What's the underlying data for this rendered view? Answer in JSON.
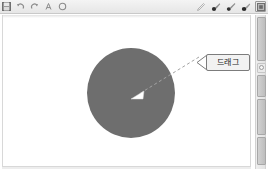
{
  "toolbar": {
    "left_tools": [
      {
        "name": "save-icon",
        "glyph": "save"
      },
      {
        "name": "undo-icon",
        "glyph": "undo"
      },
      {
        "name": "redo-icon",
        "glyph": "redo"
      },
      {
        "name": "text-icon",
        "glyph": "text"
      },
      {
        "name": "shape-icon",
        "glyph": "shape"
      }
    ],
    "right_tools": [
      {
        "name": "pencil-icon",
        "glyph": "pencil",
        "selected": false
      },
      {
        "name": "brush-icon",
        "glyph": "brush",
        "selected": false
      },
      {
        "name": "marker-icon",
        "glyph": "marker",
        "selected": false
      },
      {
        "name": "highlighter-icon",
        "glyph": "brush2",
        "selected": false
      },
      {
        "name": "shape-tool-icon",
        "glyph": "square",
        "selected": true
      }
    ]
  },
  "canvas": {
    "shape": {
      "type": "ellipse",
      "fill_color": "#6e6e6e",
      "left": 84,
      "top": 33,
      "width": 88,
      "height": 90
    },
    "arrow": {
      "style": "dashed",
      "color": "#9a9a9a",
      "head_color": "#ffffff",
      "from_x": 196,
      "from_y": 42,
      "to_x": 130,
      "to_y": 82
    }
  },
  "callout": {
    "label": "드래그",
    "border_color": "#7c7c7c",
    "background_color": "#f2f2f2",
    "text_color": "#1a1a1a"
  },
  "scrollbar": {
    "orientation": "vertical",
    "track_color": "#e6e6e6",
    "thumb_color": "#c4c4c4"
  }
}
